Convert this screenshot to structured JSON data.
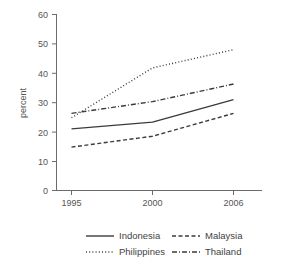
{
  "chart_data": {
    "type": "line",
    "title": "",
    "xlabel": "",
    "ylabel": "percent",
    "x": [
      1995,
      2000,
      2006
    ],
    "categories": [
      "1995",
      "2000",
      "2006"
    ],
    "xtick_labels": [
      "1995",
      "2000",
      "2006"
    ],
    "ytick_labels": [
      "0",
      "10",
      "20",
      "30",
      "40",
      "50",
      "60"
    ],
    "ytick_values": [
      0,
      10,
      20,
      30,
      40,
      50,
      60
    ],
    "ylim": [
      0,
      60
    ],
    "xlim": [
      1993.5,
      2008.5
    ],
    "grid": false,
    "legend_position": "bottom",
    "series": [
      {
        "name": "Indonesia",
        "style": "solid",
        "color": "#3b3b3b",
        "values": [
          21,
          23.3,
          31
        ]
      },
      {
        "name": "Malaysia",
        "style": "dashed",
        "color": "#3b3b3b",
        "values": [
          14.8,
          18.5,
          26.3
        ]
      },
      {
        "name": "Philippines",
        "style": "dotted",
        "color": "#3b3b3b",
        "values": [
          24.8,
          41.8,
          48
        ]
      },
      {
        "name": "Thailand",
        "style": "dashdot",
        "color": "#3b3b3b",
        "values": [
          26.3,
          30.3,
          36.3
        ]
      }
    ]
  },
  "legend": {
    "entries": [
      {
        "label": "Indonesia",
        "style": "solid"
      },
      {
        "label": "Malaysia",
        "style": "dashed"
      },
      {
        "label": "Philippines",
        "style": "dotted"
      },
      {
        "label": "Thailand",
        "style": "dashdot"
      }
    ]
  },
  "axes": {
    "y_axis_title": "percent",
    "y_ticks": [
      "60",
      "50",
      "40",
      "30",
      "20",
      "10",
      "0"
    ],
    "x_ticks": [
      "1995",
      "2000",
      "2006"
    ]
  }
}
